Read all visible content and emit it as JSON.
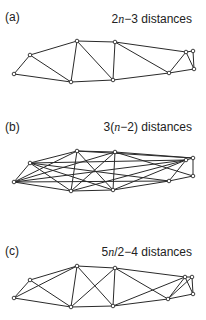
{
  "figure": {
    "panels": [
      {
        "label": "(a)",
        "caption_prefix": "2",
        "caption_var": "n",
        "caption_suffix": "−3 distances",
        "caption": "2n−3 distances",
        "nodes": {
          "A": [
            14,
            74
          ],
          "B": [
            30,
            55
          ],
          "C": [
            77,
            41
          ],
          "D": [
            71,
            82
          ],
          "E": [
            115,
            42
          ],
          "F": [
            113,
            80
          ],
          "G": [
            169,
            73
          ],
          "H": [
            186,
            52
          ],
          "I": [
            193,
            51
          ],
          "J": [
            194,
            69
          ]
        },
        "edges": [
          [
            "A",
            "B"
          ],
          [
            "A",
            "D"
          ],
          [
            "B",
            "C"
          ],
          [
            "B",
            "D"
          ],
          [
            "C",
            "D"
          ],
          [
            "C",
            "E"
          ],
          [
            "C",
            "F"
          ],
          [
            "E",
            "F"
          ],
          [
            "D",
            "F"
          ],
          [
            "E",
            "G"
          ],
          [
            "E",
            "H"
          ],
          [
            "F",
            "G"
          ],
          [
            "G",
            "H"
          ],
          [
            "G",
            "J"
          ],
          [
            "H",
            "I"
          ],
          [
            "H",
            "J"
          ],
          [
            "I",
            "J"
          ]
        ]
      },
      {
        "label": "(b)",
        "caption_prefix": "3(",
        "caption_var": "n",
        "caption_suffix": "−2) distances",
        "caption": "3(n−2) distances",
        "nodes": {
          "A": [
            14,
            182
          ],
          "B": [
            30,
            163
          ],
          "C": [
            77,
            151
          ],
          "D": [
            71,
            191
          ],
          "E": [
            115,
            152
          ],
          "F": [
            113,
            190
          ],
          "G": [
            169,
            181
          ],
          "H": [
            186,
            160
          ],
          "I": [
            193,
            158
          ],
          "J": [
            193,
            176
          ]
        },
        "edges": [
          [
            "A",
            "B"
          ],
          [
            "A",
            "D"
          ],
          [
            "A",
            "C"
          ],
          [
            "A",
            "E"
          ],
          [
            "A",
            "G"
          ],
          [
            "A",
            "H"
          ],
          [
            "B",
            "C"
          ],
          [
            "B",
            "D"
          ],
          [
            "B",
            "F"
          ],
          [
            "B",
            "G"
          ],
          [
            "B",
            "H"
          ],
          [
            "C",
            "D"
          ],
          [
            "C",
            "E"
          ],
          [
            "C",
            "F"
          ],
          [
            "C",
            "I"
          ],
          [
            "D",
            "F"
          ],
          [
            "D",
            "E"
          ],
          [
            "D",
            "H"
          ],
          [
            "E",
            "F"
          ],
          [
            "E",
            "I"
          ],
          [
            "E",
            "J"
          ],
          [
            "F",
            "G"
          ],
          [
            "F",
            "H"
          ],
          [
            "G",
            "H"
          ],
          [
            "G",
            "J"
          ],
          [
            "H",
            "I"
          ],
          [
            "I",
            "J"
          ]
        ]
      },
      {
        "label": "(c)",
        "caption_prefix": "5",
        "caption_var": "n",
        "caption_suffix": "/2−4 distances",
        "caption": "5n/2−4 distances",
        "nodes": {
          "A": [
            14,
            298
          ],
          "B": [
            30,
            280
          ],
          "C": [
            77,
            266
          ],
          "D": [
            71,
            307
          ],
          "E": [
            115,
            268
          ],
          "F": [
            113,
            306
          ],
          "G": [
            168,
            299
          ],
          "H": [
            185,
            277
          ],
          "I": [
            192,
            277
          ],
          "J": [
            193,
            294
          ]
        },
        "edges": [
          [
            "A",
            "B"
          ],
          [
            "A",
            "D"
          ],
          [
            "A",
            "C"
          ],
          [
            "B",
            "C"
          ],
          [
            "B",
            "D"
          ],
          [
            "C",
            "D"
          ],
          [
            "C",
            "E"
          ],
          [
            "C",
            "F"
          ],
          [
            "D",
            "E"
          ],
          [
            "D",
            "F"
          ],
          [
            "E",
            "F"
          ],
          [
            "E",
            "G"
          ],
          [
            "E",
            "H"
          ],
          [
            "F",
            "H"
          ],
          [
            "F",
            "G"
          ],
          [
            "G",
            "H"
          ],
          [
            "G",
            "I"
          ],
          [
            "G",
            "J"
          ],
          [
            "H",
            "I"
          ],
          [
            "H",
            "J"
          ],
          [
            "I",
            "J"
          ]
        ]
      }
    ],
    "label_positions": [
      {
        "label_top": 10,
        "caption_top": 12
      },
      {
        "label_top": 120,
        "caption_top": 120
      },
      {
        "label_top": 244,
        "caption_top": 245
      }
    ]
  }
}
